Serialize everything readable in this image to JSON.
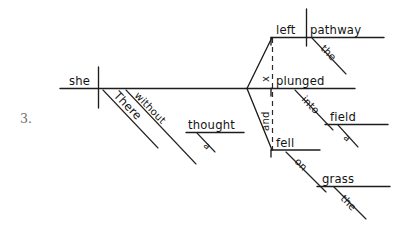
{
  "page": {
    "background_color": "#ffffff",
    "ink_color": "#141414",
    "item_number": "3.",
    "diagram_type": "reed-kellogg-sentence-diagram"
  },
  "diagram": {
    "subject": {
      "label": "she",
      "role": "subject"
    },
    "modifiers_of_subject_line": [
      {
        "label": "There",
        "role": "adverb-modifier"
      },
      {
        "label": "without",
        "role": "preposition"
      },
      {
        "label": "thought",
        "role": "object-of-preposition"
      },
      {
        "label": "a",
        "role": "article-modifier"
      }
    ],
    "compound_predicates": [
      {
        "verb": "left",
        "direct_object": "pathway",
        "object_modifier": "the"
      },
      {
        "verb": "plunged",
        "preposition": "into",
        "prep_object": "field",
        "object_modifier": "a"
      },
      {
        "verb": "fell",
        "preposition": "on",
        "prep_object": "grass",
        "object_modifier": "the"
      }
    ],
    "conjunction_marks": [
      {
        "label": "x",
        "role": "ellipsis-conjunction-mark"
      },
      {
        "label": "and",
        "role": "coordinating-conjunction"
      }
    ]
  }
}
